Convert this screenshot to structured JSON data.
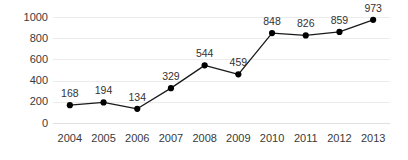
{
  "chart_data": {
    "type": "line",
    "title": "",
    "subtitle": "",
    "xlabel": "",
    "ylabel": "",
    "categories": [
      "2004",
      "2005",
      "2006",
      "2007",
      "2008",
      "2009",
      "2010",
      "2011",
      "2012",
      "2013"
    ],
    "values": [
      168,
      194,
      134,
      329,
      544,
      459,
      848,
      826,
      859,
      973
    ],
    "point_labels": [
      "168",
      "194",
      "134",
      "329",
      "544",
      "459",
      "848",
      "826",
      "859",
      "973"
    ],
    "ylim": [
      0,
      1000
    ],
    "y_ticks": [
      0,
      200,
      400,
      600,
      800,
      1000
    ],
    "y_tick_labels": [
      "0",
      "200",
      "400",
      "600",
      "800",
      "1000"
    ],
    "grid": true,
    "grid_axis": "y",
    "legend": false,
    "legend_position": "none",
    "series": [
      {
        "name": "",
        "values": [
          168,
          194,
          134,
          329,
          544,
          459,
          848,
          826,
          859,
          973
        ]
      }
    ],
    "colors": {
      "line": "#1a1a1a",
      "marker": "#000000",
      "gridline": "#ececec",
      "baseline": "#e0e0e0",
      "background": "#ffffff",
      "tick_text": "#3a3a3a",
      "label_text": "#333333"
    },
    "marker": "circle",
    "data_labels_visible": true
  }
}
